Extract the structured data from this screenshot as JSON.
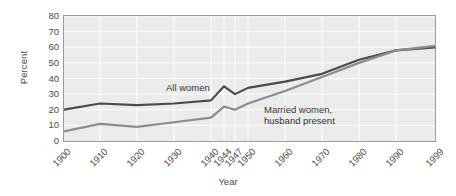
{
  "chart_data": {
    "type": "line",
    "title": "",
    "subtitle": "",
    "xlabel": "Year",
    "ylabel": "Percent",
    "x": [
      1900,
      1910,
      1920,
      1930,
      1940,
      1944,
      1947,
      1950,
      1960,
      1970,
      1980,
      1990,
      1999
    ],
    "xticklabels": [
      "1900",
      "1910",
      "1920",
      "1930",
      "1940",
      "1944",
      "1947",
      "1950",
      "1960",
      "1970",
      "1980",
      "1990",
      "1999"
    ],
    "yticklabels": [
      "0",
      "10",
      "20",
      "30",
      "40",
      "50",
      "60",
      "70",
      "80"
    ],
    "yticks": [
      0,
      10,
      20,
      30,
      40,
      50,
      60,
      70,
      80
    ],
    "ylim": [
      0,
      80
    ],
    "xlim": [
      1900,
      1999
    ],
    "grid": true,
    "grid_color": "#ffffff",
    "plot_background": "#ebebeb",
    "legend_position": "inline-annotation",
    "series": [
      {
        "name": "All women",
        "color": "#4a4a4a",
        "annotation": "All women",
        "values": [
          20,
          24,
          23,
          24,
          26,
          35,
          30,
          34,
          38,
          43,
          52,
          58,
          60
        ]
      },
      {
        "name": "Married women, husband present",
        "color": "#8c8c8c",
        "annotation": "Married women,\nhusband present",
        "values": [
          6,
          11,
          9,
          12,
          15,
          22,
          20,
          24,
          32,
          41,
          50,
          58,
          61
        ]
      }
    ]
  },
  "axis": {
    "border_color": "#9a9a9a",
    "tick_text_color": "#4a4a4a"
  }
}
